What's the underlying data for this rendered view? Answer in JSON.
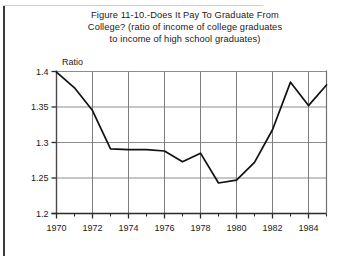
{
  "figure": {
    "title": "Figure 11-10.-Does It Pay To Graduate From College? (ratio of income of college graduates to income of high school graduates)",
    "title_line1": "Figure 11-10.-Does It Pay To Graduate From",
    "title_line2": "College? (ratio of income of college graduates",
    "title_line3": "to income of high school graduates)",
    "axis_unit_label": "Ratio",
    "footnote_partial": ""
  },
  "chart_data": {
    "type": "line",
    "title": "Figure 11-10.-Does It Pay To Graduate From College? (ratio of income of college graduates to income of high school graduates)",
    "xlabel": "",
    "ylabel": "Ratio",
    "xlim": [
      1970,
      1985
    ],
    "ylim": [
      1.2,
      1.4
    ],
    "yticks": [
      1.2,
      1.25,
      1.3,
      1.35,
      1.4
    ],
    "ytick_labels": [
      "1.2",
      "1.25",
      "1.3",
      "1.35",
      "1.4"
    ],
    "xticks": [
      1970,
      1972,
      1974,
      1976,
      1978,
      1980,
      1982,
      1984
    ],
    "xtick_labels": [
      "1970",
      "1972",
      "1974",
      "1976",
      "1978",
      "1980",
      "1982",
      "1984"
    ],
    "minor_xticks": [
      1971,
      1973,
      1975,
      1977,
      1979,
      1981,
      1983,
      1985
    ],
    "grid": true,
    "legend": "none",
    "series": [
      {
        "name": "Ratio of income of college graduates to high school graduates",
        "x": [
          1970,
          1971,
          1972,
          1973,
          1974,
          1975,
          1976,
          1977,
          1978,
          1979,
          1980,
          1981,
          1982,
          1983,
          1984,
          1985
        ],
        "values": [
          1.399,
          1.377,
          1.345,
          1.291,
          1.29,
          1.29,
          1.288,
          1.273,
          1.285,
          1.243,
          1.247,
          1.272,
          1.318,
          1.385,
          1.352,
          1.381
        ]
      }
    ]
  }
}
